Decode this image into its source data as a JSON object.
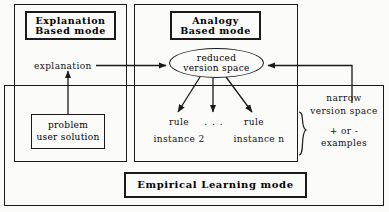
{
  "diagram": {
    "colors": {
      "stroke": "#1a1a1a",
      "background": "#fbfbf9",
      "text": "#111111"
    },
    "outer_container": {
      "name": "empirical-learning-container"
    },
    "modes": [
      {
        "id": "explanation-based-mode",
        "line1": "Explanation",
        "line2": "Based   mode"
      },
      {
        "id": "analogy-based-mode",
        "line1": "Analogy",
        "line2": "Based   mode"
      },
      {
        "id": "empirical-learning-mode",
        "line1": "Empirical   Learning   mode",
        "line2": ""
      }
    ],
    "nodes": {
      "reduced_version_space": {
        "line1": "reduced",
        "line2": "version   space"
      },
      "problem_user_solution": {
        "line1": "problem",
        "line2": "user solution"
      }
    },
    "labels": {
      "explanation": "explanation",
      "rule_left_line1": "rule",
      "rule_left_line2": "instance  2",
      "ellipsis": ". . .",
      "rule_right_line1": "rule",
      "rule_right_line2": "instance   n",
      "narrow_line1": "narrow",
      "narrow_line2": "version   space",
      "examples_line1": "+  or  -",
      "examples_line2": "examples"
    }
  }
}
